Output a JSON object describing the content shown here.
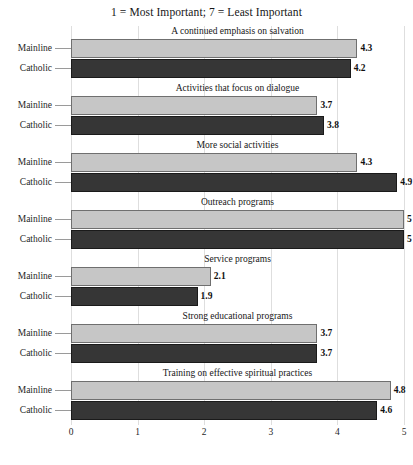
{
  "chart_data": {
    "type": "bar",
    "title": "1 = Most Important; 7 = Least Important",
    "orientation": "horizontal",
    "xlabel": "",
    "ylabel": "",
    "xlim": [
      0,
      5
    ],
    "xticks": [
      "0",
      "1",
      "2",
      "3",
      "4",
      "5"
    ],
    "grid": true,
    "legend_position": "none",
    "categories": [
      "Mainline",
      "Catholic"
    ],
    "panels": [
      {
        "title": "A continued emphasis on salvation",
        "bars": [
          {
            "category": "Mainline",
            "value": 4.3,
            "label": "4.3"
          },
          {
            "category": "Catholic",
            "value": 4.2,
            "label": "4.2"
          }
        ]
      },
      {
        "title": "Activities that focus on dialogue",
        "bars": [
          {
            "category": "Mainline",
            "value": 3.7,
            "label": "3.7"
          },
          {
            "category": "Catholic",
            "value": 3.8,
            "label": "3.8"
          }
        ]
      },
      {
        "title": "More social activities",
        "bars": [
          {
            "category": "Mainline",
            "value": 4.3,
            "label": "4.3"
          },
          {
            "category": "Catholic",
            "value": 4.9,
            "label": "4.9"
          }
        ]
      },
      {
        "title": "Outreach programs",
        "bars": [
          {
            "category": "Mainline",
            "value": 5.0,
            "label": "5"
          },
          {
            "category": "Catholic",
            "value": 5.0,
            "label": "5"
          }
        ]
      },
      {
        "title": "Service programs",
        "bars": [
          {
            "category": "Mainline",
            "value": 2.1,
            "label": "2.1"
          },
          {
            "category": "Catholic",
            "value": 1.9,
            "label": "1.9"
          }
        ]
      },
      {
        "title": "Strong educational programs",
        "bars": [
          {
            "category": "Mainline",
            "value": 3.7,
            "label": "3.7"
          },
          {
            "category": "Catholic",
            "value": 3.7,
            "label": "3.7"
          }
        ]
      },
      {
        "title": "Training on effective spiritual practices",
        "bars": [
          {
            "category": "Mainline",
            "value": 4.8,
            "label": "4.8"
          },
          {
            "category": "Catholic",
            "value": 4.6,
            "label": "4.6"
          }
        ]
      }
    ],
    "colors": {
      "mainline": "#c6c6c6",
      "catholic": "#363636",
      "grid": "#dedede",
      "text": "#1a1a1a"
    }
  }
}
